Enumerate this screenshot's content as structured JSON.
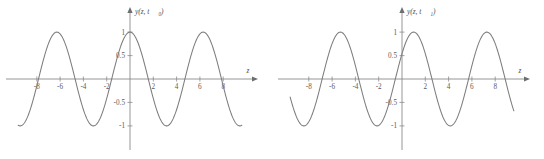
{
  "figure": {
    "background_color": "#ffffff",
    "curve_color": "#7d7d7d",
    "axis_color": "#8a8a8a",
    "label_color": "#5b5b5b",
    "panel_count": 2
  },
  "chart_data": [
    {
      "type": "line",
      "title": "",
      "name": "wave-snapshot-t0",
      "xlabel": "z",
      "ylabel": "y(z, t₀)",
      "ylabel_base": "y(z, t",
      "ylabel_sub": "0",
      "ylabel_close": ")",
      "xlim": [
        -9.6,
        9.6
      ],
      "ylim": [
        -1.25,
        1.25
      ],
      "grid": false,
      "legend": "none",
      "xticks": [
        -8,
        -6,
        -4,
        -2,
        2,
        4,
        6,
        8
      ],
      "xtick_labels": [
        "-8",
        "-6",
        "-4",
        "-2",
        "2",
        "4",
        "6",
        "8"
      ],
      "yticks": [
        1,
        0.5,
        -0.5,
        -1
      ],
      "ytick_labels": [
        "1",
        "0.5",
        "-0.5",
        "-1"
      ],
      "function": "cos(z)",
      "amplitude": 1,
      "wavelength": 6.2832,
      "phase_shift": 0,
      "x": [
        -9.6,
        -9.2,
        -8.8,
        -8.4,
        -8.0,
        -7.6,
        -7.2,
        -6.8,
        -6.4,
        -6.0,
        -5.6,
        -5.2,
        -4.8,
        -4.4,
        -4.0,
        -3.6,
        -3.2,
        -2.8,
        -2.4,
        -2.0,
        -1.6,
        -1.2,
        -0.8,
        -0.4,
        0.0,
        0.4,
        0.8,
        1.2,
        1.6,
        2.0,
        2.4,
        2.8,
        3.2,
        3.6,
        4.0,
        4.4,
        4.8,
        5.2,
        5.6,
        6.0,
        6.4,
        6.8,
        7.2,
        7.6,
        8.0,
        8.4,
        8.8,
        9.2,
        9.6
      ],
      "y": [
        -0.985,
        -0.875,
        -0.811,
        -0.519,
        -0.146,
        0.251,
        0.608,
        0.869,
        0.993,
        0.96,
        0.775,
        0.469,
        0.087,
        -0.307,
        -0.654,
        -0.897,
        -0.998,
        -0.942,
        -0.737,
        -0.416,
        -0.029,
        0.362,
        0.697,
        0.921,
        1.0,
        0.921,
        0.697,
        0.362,
        -0.029,
        -0.416,
        -0.737,
        -0.942,
        -0.998,
        -0.897,
        -0.654,
        -0.307,
        0.087,
        0.469,
        0.775,
        0.96,
        0.993,
        0.869,
        0.608,
        0.251,
        -0.146,
        -0.519,
        -0.811,
        -0.875,
        -0.985
      ]
    },
    {
      "type": "line",
      "title": "",
      "name": "wave-snapshot-t1",
      "xlabel": "z",
      "ylabel": "y(z, t₁)",
      "ylabel_base": "y(z, t",
      "ylabel_sub": "1",
      "ylabel_close": ")",
      "xlim": [
        -9.6,
        9.6
      ],
      "ylim": [
        -1.25,
        1.25
      ],
      "grid": false,
      "legend": "none",
      "xticks": [
        -8,
        -6,
        -4,
        -2,
        2,
        4,
        6,
        8
      ],
      "xtick_labels": [
        "-8",
        "-6",
        "-4",
        "-2",
        "2",
        "4",
        "6",
        "8"
      ],
      "yticks": [
        1,
        0.5,
        -0.5,
        -1
      ],
      "ytick_labels": [
        "1",
        "0.5",
        "-0.5",
        "-1"
      ],
      "function": "cos(z - 1)",
      "amplitude": 1,
      "wavelength": 6.2832,
      "phase_shift": 1.0,
      "x": [
        -9.6,
        -9.2,
        -8.8,
        -8.4,
        -8.0,
        -7.6,
        -7.2,
        -6.8,
        -6.4,
        -6.0,
        -5.6,
        -5.2,
        -4.8,
        -4.4,
        -4.0,
        -3.6,
        -3.2,
        -2.8,
        -2.4,
        -2.0,
        -1.6,
        -1.2,
        -0.8,
        -0.4,
        0.0,
        0.4,
        0.8,
        1.2,
        1.6,
        2.0,
        2.4,
        2.8,
        3.2,
        3.6,
        4.0,
        4.4,
        4.8,
        5.2,
        5.6,
        6.0,
        6.4,
        6.8,
        7.2,
        7.6,
        8.0,
        8.4,
        8.8,
        9.2,
        9.6
      ],
      "y": [
        -0.56,
        -0.833,
        -0.979,
        -0.985,
        -0.854,
        -0.602,
        -0.259,
        0.128,
        0.504,
        0.801,
        0.969,
        0.99,
        0.865,
        0.62,
        0.284,
        -0.103,
        -0.484,
        -0.788,
        -0.964,
        -0.99,
        -0.873,
        -0.637,
        -0.307,
        0.078,
        0.54,
        0.825,
        0.98,
        0.98,
        0.825,
        0.54,
        0.078,
        -0.307,
        -0.637,
        -0.873,
        -0.99,
        -0.964,
        -0.788,
        -0.484,
        -0.103,
        0.284,
        0.62,
        0.865,
        0.99,
        0.969,
        0.801,
        0.504,
        0.128,
        -0.259,
        -0.602
      ]
    }
  ]
}
